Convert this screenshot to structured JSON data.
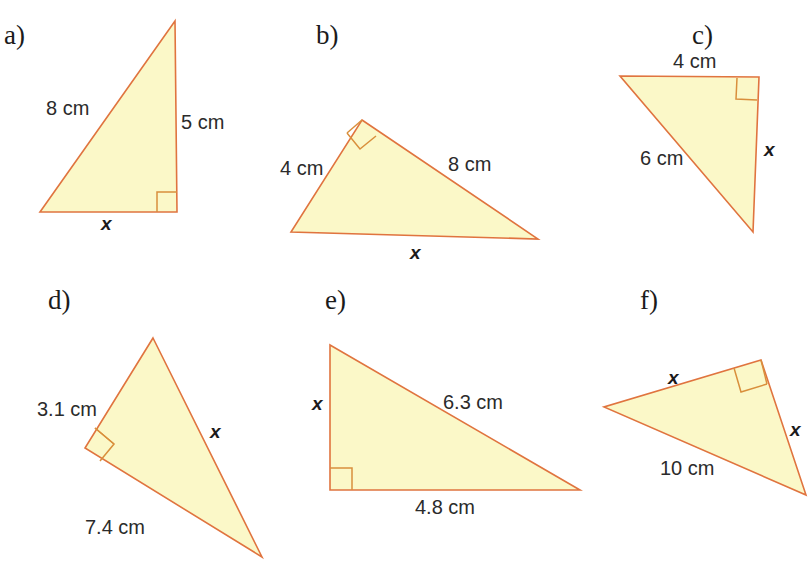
{
  "page": {
    "background_color": "#ffffff",
    "width": 812,
    "height": 564
  },
  "style": {
    "triangle_fill": "#fbf8c8",
    "triangle_stroke": "#e0743f",
    "right_angle_stroke": "#d98f3c",
    "text_color": "#1b1b1b"
  },
  "figures": [
    {
      "id": "a",
      "letter": "a)",
      "letter_pos": {
        "x": 4,
        "y": 22
      },
      "points": "175,21 177,212 40,212",
      "right_angle": "157,212 157,192 177,192",
      "labels": [
        {
          "name": "side-8cm",
          "text": "8 cm",
          "kind": "measurement",
          "x": 46,
          "y": 98
        },
        {
          "name": "side-5cm",
          "text": "5 cm",
          "kind": "measurement",
          "x": 181,
          "y": 112
        },
        {
          "name": "side-x",
          "text": "x",
          "kind": "variable",
          "x": 101,
          "y": 214
        }
      ]
    },
    {
      "id": "b",
      "letter": "b)",
      "letter_pos": {
        "x": 316,
        "y": 22
      },
      "points": "362,120 538,239 291,232",
      "right_angle": "347,133 360,149 376,136",
      "right_angle_extra": "362,120 347,133",
      "labels": [
        {
          "name": "side-4cm",
          "text": "4 cm",
          "kind": "measurement",
          "x": 280,
          "y": 158
        },
        {
          "name": "side-8cm",
          "text": "8 cm",
          "kind": "measurement",
          "x": 448,
          "y": 154
        },
        {
          "name": "side-x",
          "text": "x",
          "kind": "variable",
          "x": 410,
          "y": 243
        }
      ]
    },
    {
      "id": "c",
      "letter": "c)",
      "letter_pos": {
        "x": 692,
        "y": 22
      },
      "points": "620,76 759,77 753,232",
      "right_angle": "737,78 736,99 757,100",
      "labels": [
        {
          "name": "side-4cm",
          "text": "4 cm",
          "kind": "measurement",
          "x": 673,
          "y": 51
        },
        {
          "name": "side-6cm",
          "text": "6 cm",
          "kind": "measurement",
          "x": 640,
          "y": 148
        },
        {
          "name": "side-x",
          "text": "x",
          "kind": "variable",
          "x": 764,
          "y": 140
        }
      ]
    },
    {
      "id": "d",
      "letter": "d)",
      "letter_pos": {
        "x": 48,
        "y": 287
      },
      "points": "153,338 262,557 85,448",
      "right_angle": "95,428 114,444 100,461",
      "right_angle_extra": "95,428 114,444",
      "labels": [
        {
          "name": "side-3-1cm",
          "text": "3.1 cm",
          "kind": "measurement",
          "x": 37,
          "y": 129
        },
        {
          "name": "side-7-4cm",
          "text": "7.4 cm",
          "kind": "measurement",
          "x": 85,
          "y": 247
        },
        {
          "name": "side-x",
          "text": "x",
          "kind": "variable",
          "x": 210,
          "y": 152
        }
      ]
    },
    {
      "id": "e",
      "letter": "e)",
      "letter_pos": {
        "x": 325,
        "y": 287
      },
      "points": "330,345 580,490 330,490",
      "right_angle": "330,468 352,468 352,490",
      "labels": [
        {
          "name": "side-6-3cm",
          "text": "6.3 cm",
          "kind": "measurement",
          "x": 443,
          "y": 122
        },
        {
          "name": "side-4-8cm",
          "text": "4.8 cm",
          "kind": "measurement",
          "x": 415,
          "y": 227
        },
        {
          "name": "side-x",
          "text": "x",
          "kind": "variable",
          "x": 312,
          "y": 124
        }
      ]
    },
    {
      "id": "f",
      "letter": "f)",
      "letter_pos": {
        "x": 640,
        "y": 287
      },
      "points": "761,360 806,495 604,407",
      "right_angle": "734,368 741,392 767,384",
      "right_angle_extra": "761,360 767,384",
      "labels": [
        {
          "name": "side-x-top",
          "text": "x",
          "kind": "variable",
          "x": 668,
          "y": 98
        },
        {
          "name": "side-x-right",
          "text": "x",
          "kind": "variable",
          "x": 790,
          "y": 150
        },
        {
          "name": "side-10cm",
          "text": "10 cm",
          "kind": "measurement",
          "x": 660,
          "y": 188
        }
      ]
    }
  ]
}
